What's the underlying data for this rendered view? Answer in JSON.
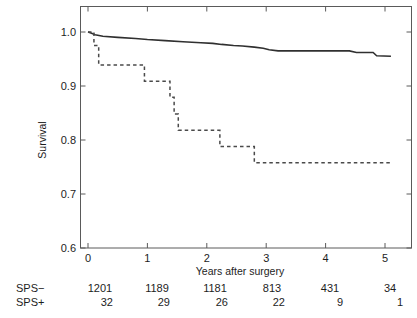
{
  "figure": {
    "type": "kaplan-meier-survival-plot",
    "background": "#ffffff",
    "line_color": "#303030"
  },
  "axes": {
    "y_title": "Survival",
    "x_title": "Years after surgery",
    "y_ticks": [
      "0.6",
      "0.7",
      "0.8",
      "0.9",
      "1.0"
    ],
    "x_ticks": [
      "0",
      "1",
      "2",
      "3",
      "4",
      "5"
    ],
    "xlim": [
      0,
      5.3
    ],
    "ylim": [
      0.6,
      1.0
    ],
    "grid": "off",
    "box": "on"
  },
  "risk_table": {
    "row_labels": [
      "SPS−",
      "SPS+"
    ],
    "time_points": [
      0,
      1,
      2,
      3,
      4,
      5
    ],
    "rows": [
      {
        "label": "SPS−",
        "values": [
          "1201",
          "1189",
          "1181",
          "813",
          "431",
          "34"
        ]
      },
      {
        "label": "SPS+",
        "values": [
          "32",
          "29",
          "26",
          "22",
          "9",
          "1"
        ]
      }
    ]
  },
  "chart_data": {
    "type": "line",
    "title": "",
    "xlabel": "Years after surgery",
    "ylabel": "Survival",
    "xlim": [
      0,
      5.3
    ],
    "ylim": [
      0.6,
      1.0
    ],
    "grid": false,
    "legend": "none",
    "series": [
      {
        "name": "SPS−",
        "style": "solid",
        "color": "#303030",
        "points": [
          [
            0.0,
            1.0
          ],
          [
            0.05,
            0.998
          ],
          [
            0.12,
            0.995
          ],
          [
            0.25,
            0.992
          ],
          [
            0.5,
            0.99
          ],
          [
            0.8,
            0.988
          ],
          [
            1.0,
            0.986
          ],
          [
            1.3,
            0.984
          ],
          [
            1.6,
            0.982
          ],
          [
            1.9,
            0.98
          ],
          [
            2.1,
            0.979
          ],
          [
            2.25,
            0.977
          ],
          [
            2.45,
            0.975
          ],
          [
            2.6,
            0.974
          ],
          [
            2.8,
            0.972
          ],
          [
            2.95,
            0.97
          ],
          [
            3.05,
            0.967
          ],
          [
            3.2,
            0.965
          ],
          [
            3.6,
            0.965
          ],
          [
            4.0,
            0.965
          ],
          [
            4.4,
            0.965
          ],
          [
            4.52,
            0.962
          ],
          [
            4.6,
            0.962
          ],
          [
            4.8,
            0.962
          ],
          [
            4.86,
            0.956
          ],
          [
            5.1,
            0.955
          ]
        ]
      },
      {
        "name": "SPS+",
        "style": "dashed",
        "color": "#4a4a4a",
        "points": [
          [
            0.0,
            1.0
          ],
          [
            0.1,
            1.0
          ],
          [
            0.1,
            0.975
          ],
          [
            0.18,
            0.975
          ],
          [
            0.18,
            0.939
          ],
          [
            0.95,
            0.939
          ],
          [
            0.95,
            0.909
          ],
          [
            1.38,
            0.909
          ],
          [
            1.38,
            0.879
          ],
          [
            1.45,
            0.879
          ],
          [
            1.45,
            0.848
          ],
          [
            1.52,
            0.848
          ],
          [
            1.52,
            0.818
          ],
          [
            2.22,
            0.818
          ],
          [
            2.22,
            0.788
          ],
          [
            2.8,
            0.788
          ],
          [
            2.8,
            0.758
          ],
          [
            5.1,
            0.758
          ]
        ]
      }
    ]
  }
}
